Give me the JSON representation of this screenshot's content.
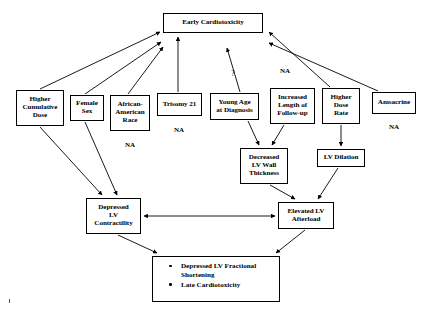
{
  "diagram": {
    "type": "flow-diagram",
    "line_color": "#000000",
    "background_color": "#ffffff",
    "nodes": [
      {
        "id": "early-cardiotoxicity",
        "label": "Early Cardiotoxicity",
        "lines": [
          "Early Cardiotoxicity"
        ],
        "x": 163,
        "y": 13,
        "w": 100,
        "h": 20,
        "annotation": null
      },
      {
        "id": "higher-cumulative-dose",
        "label": "Higher Cumulative Dose",
        "lines": [
          "Higher",
          "Cumulative",
          "Dose"
        ],
        "x": 16,
        "y": 90,
        "w": 48,
        "h": 36,
        "annotation": null
      },
      {
        "id": "female-sex",
        "label": "Female Sex",
        "lines": [
          "Female",
          "Sex"
        ],
        "x": 70,
        "y": 95,
        "w": 34,
        "h": 26,
        "annotation": null
      },
      {
        "id": "african-american-race",
        "label": "African-American Race",
        "lines": [
          "African-",
          "American",
          "Race"
        ],
        "x": 110,
        "y": 95,
        "w": 40,
        "h": 36,
        "annotation": "NA",
        "annotation_x": 130,
        "annotation_y": 146
      },
      {
        "id": "trisomy-21",
        "label": "Trisomy 21",
        "lines": [
          "Trisomy 21"
        ],
        "x": 157,
        "y": 93,
        "w": 45,
        "h": 23,
        "annotation": "NA",
        "annotation_x": 179,
        "annotation_y": 131
      },
      {
        "id": "young-age-at-diagnosis",
        "label": "Young Age at Diagnosis",
        "lines": [
          "Young Age",
          "at Diagnosis"
        ],
        "x": 210,
        "y": 93,
        "w": 49,
        "h": 27,
        "annotation": null
      },
      {
        "id": "increased-length-of-follow-up",
        "label": "Increased Length of Follow-up",
        "lines": [
          "Increased",
          "Length of",
          "Follow-up"
        ],
        "x": 270,
        "y": 88,
        "w": 45,
        "h": 36,
        "annotation": null
      },
      {
        "id": "higher-dose-rate",
        "label": "Higher Dose Rate",
        "lines": [
          "Higher",
          "Dose",
          "Rate"
        ],
        "x": 322,
        "y": 88,
        "w": 38,
        "h": 36,
        "annotation": null
      },
      {
        "id": "amsacrine",
        "label": "Amsacrine",
        "lines": [
          "Amsacrine"
        ],
        "x": 372,
        "y": 92,
        "w": 44,
        "h": 22,
        "annotation": "NA",
        "annotation_x": 394,
        "annotation_y": 128
      },
      {
        "id": "decreased-lv-wall-thickness",
        "label": "Decreased LV Wall Thickness",
        "lines": [
          "Decreased",
          "LV Wall",
          "Thickness"
        ],
        "x": 240,
        "y": 148,
        "w": 48,
        "h": 36,
        "annotation": null
      },
      {
        "id": "lv-dilation",
        "label": "LV Dilation",
        "lines": [
          "LV Dilation"
        ],
        "x": 317,
        "y": 149,
        "w": 48,
        "h": 18,
        "annotation": null
      },
      {
        "id": "depressed-lv-contractility",
        "label": "Depressed LV Contractility",
        "lines": [
          "Depressed",
          "LV",
          "Contractility"
        ],
        "x": 86,
        "y": 198,
        "w": 55,
        "h": 36,
        "annotation": null
      },
      {
        "id": "elevated-lv-afterload",
        "label": "Elevated LV Afterload",
        "lines": [
          "Elevated LV",
          "Afterload"
        ],
        "x": 278,
        "y": 202,
        "w": 56,
        "h": 27,
        "annotation": null
      }
    ],
    "outcome_box": {
      "id": "late-outcomes",
      "x": 152,
      "y": 256,
      "w": 128,
      "h": 46,
      "items": [
        "Depressed LV Fractional Shortening",
        "Late Cardiotoxicity"
      ]
    },
    "floating_annotations": [
      {
        "id": "question-mark",
        "text": "?",
        "x": 233,
        "y": 74
      },
      {
        "id": "na-follow-up",
        "text": "NA",
        "x": 285,
        "y": 71
      }
    ],
    "edges": [
      {
        "from": "higher-cumulative-dose",
        "to": "early-cardiotoxicity",
        "style": "arrow",
        "direction": "one-way"
      },
      {
        "from": "female-sex",
        "to": "early-cardiotoxicity",
        "style": "arrow",
        "direction": "one-way"
      },
      {
        "from": "african-american-race",
        "to": "early-cardiotoxicity",
        "style": "arrow",
        "direction": "one-way"
      },
      {
        "from": "trisomy-21",
        "to": "early-cardiotoxicity",
        "style": "arrow",
        "direction": "one-way"
      },
      {
        "from": "young-age-at-diagnosis",
        "to": "early-cardiotoxicity",
        "style": "arrow",
        "direction": "one-way",
        "label": "?"
      },
      {
        "from": "higher-dose-rate",
        "to": "early-cardiotoxicity",
        "style": "arrow",
        "direction": "one-way"
      },
      {
        "from": "amsacrine",
        "to": "early-cardiotoxicity",
        "style": "arrow",
        "direction": "one-way"
      },
      {
        "from": "young-age-at-diagnosis",
        "to": "decreased-lv-wall-thickness",
        "style": "arrow",
        "direction": "one-way"
      },
      {
        "from": "increased-length-of-follow-up",
        "to": "decreased-lv-wall-thickness",
        "style": "arrow",
        "direction": "one-way"
      },
      {
        "from": "higher-dose-rate",
        "to": "lv-dilation",
        "style": "arrow",
        "direction": "one-way"
      },
      {
        "from": "higher-cumulative-dose",
        "to": "depressed-lv-contractility",
        "style": "arrow",
        "direction": "one-way"
      },
      {
        "from": "female-sex",
        "to": "depressed-lv-contractility",
        "style": "arrow",
        "direction": "one-way"
      },
      {
        "from": "decreased-lv-wall-thickness",
        "to": "elevated-lv-afterload",
        "style": "arrow",
        "direction": "one-way"
      },
      {
        "from": "lv-dilation",
        "to": "elevated-lv-afterload",
        "style": "arrow",
        "direction": "one-way"
      },
      {
        "from": "depressed-lv-contractility",
        "to": "elevated-lv-afterload",
        "style": "arrow",
        "direction": "two-way"
      },
      {
        "from": "depressed-lv-contractility",
        "to": "late-outcomes",
        "style": "arrow",
        "direction": "one-way"
      },
      {
        "from": "elevated-lv-afterload",
        "to": "late-outcomes",
        "style": "arrow",
        "direction": "one-way"
      }
    ]
  }
}
